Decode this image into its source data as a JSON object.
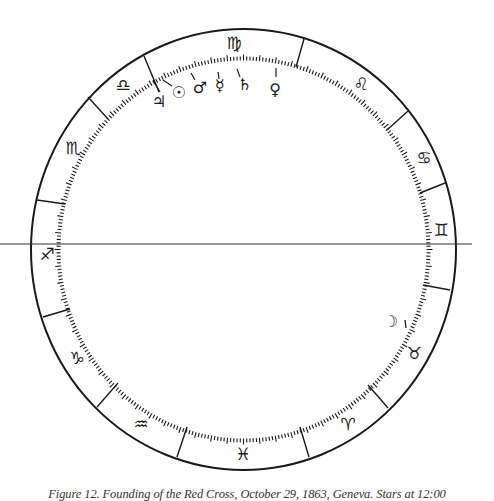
{
  "figure": {
    "caption": "Figure 12. Founding of the Red Cross, October 29, 1863, Geneva. Stars at 12:00",
    "line_color": "#1a1a1a",
    "background": "#ffffff"
  },
  "wheel": {
    "center": [
      243.5,
      249.5
    ],
    "outer_radius": [
      212.5,
      220.5
    ],
    "inner_radius": [
      183,
      189
    ],
    "horizon_line": {
      "y": 244,
      "x1": 0,
      "x2": 472
    },
    "tick_count": 360
  },
  "cusps": [
    {
      "between": "leo-virgo",
      "x1": 304,
      "y1": 39,
      "x2": 296,
      "y2": 67
    },
    {
      "between": "virgo-libra",
      "x1": 144,
      "y1": 56,
      "x2": 159,
      "y2": 92
    },
    {
      "between": "libra-scorpio",
      "x1": 88,
      "y1": 97,
      "x2": 108,
      "y2": 119
    },
    {
      "between": "scorpio-sagittarius",
      "x1": 37,
      "y1": 200,
      "x2": 65,
      "y2": 204
    },
    {
      "between": "sagittarius-capricorn",
      "x1": 43,
      "y1": 317,
      "x2": 70,
      "y2": 309
    },
    {
      "between": "capricorn-aquarius",
      "x1": 97,
      "y1": 407,
      "x2": 118,
      "y2": 383
    },
    {
      "between": "aquarius-pisces",
      "x1": 177,
      "y1": 457,
      "x2": 187,
      "y2": 427
    },
    {
      "between": "pisces-aries",
      "x1": 309,
      "y1": 457,
      "x2": 300,
      "y2": 427
    },
    {
      "between": "aries-taurus",
      "x1": 388,
      "y1": 408,
      "x2": 368,
      "y2": 385
    },
    {
      "between": "taurus-gemini",
      "x1": 450,
      "y1": 290,
      "x2": 423,
      "y2": 285
    },
    {
      "between": "gemini-cancer",
      "x1": 445,
      "y1": 183,
      "x2": 420,
      "y2": 193
    },
    {
      "between": "cancer-leo",
      "x1": 408,
      "y1": 111,
      "x2": 387,
      "y2": 130
    }
  ],
  "signs": [
    {
      "name": "virgo",
      "glyph": "♍",
      "x": 234,
      "y": 43
    },
    {
      "name": "leo",
      "glyph": "♌",
      "x": 361,
      "y": 84
    },
    {
      "name": "cancer",
      "glyph": "♋",
      "x": 424,
      "y": 158
    },
    {
      "name": "gemini",
      "glyph": "♊",
      "x": 441,
      "y": 230
    },
    {
      "name": "taurus",
      "glyph": "♉",
      "x": 414,
      "y": 353
    },
    {
      "name": "aries",
      "glyph": "♈",
      "x": 348,
      "y": 424
    },
    {
      "name": "pisces",
      "glyph": "♓",
      "x": 243,
      "y": 454
    },
    {
      "name": "aquarius",
      "glyph": "♒",
      "x": 141,
      "y": 424
    },
    {
      "name": "capricorn",
      "glyph": "♑",
      "x": 77,
      "y": 358
    },
    {
      "name": "sagittarius",
      "glyph": "♐",
      "x": 47,
      "y": 254
    },
    {
      "name": "scorpio",
      "glyph": "♏",
      "x": 73,
      "y": 148
    },
    {
      "name": "libra",
      "glyph": "♎",
      "x": 123,
      "y": 85
    }
  ],
  "planets": [
    {
      "name": "jupiter",
      "glyph": "♃",
      "x": 159,
      "y": 101,
      "tick": [
        153,
        80,
        160,
        92
      ]
    },
    {
      "name": "sun",
      "glyph": "☉",
      "x": 179,
      "y": 92,
      "tick": [
        163,
        80,
        172,
        86
      ]
    },
    {
      "name": "mars",
      "glyph": "♂",
      "x": 200,
      "y": 87,
      "tick": [
        191,
        73,
        195,
        80
      ]
    },
    {
      "name": "mercury",
      "glyph": "☿",
      "x": 220,
      "y": 85,
      "tick": [
        218,
        72,
        219,
        79
      ]
    },
    {
      "name": "saturn",
      "glyph": "♄",
      "x": 245,
      "y": 84,
      "tick": [
        237,
        69,
        240,
        77
      ]
    },
    {
      "name": "venus",
      "glyph": "♀",
      "x": 275,
      "y": 89,
      "tick": [
        276,
        68,
        276,
        77
      ]
    },
    {
      "name": "moon",
      "glyph": "☽",
      "x": 391,
      "y": 321,
      "tick": [
        405,
        320,
        406,
        328
      ]
    }
  ]
}
